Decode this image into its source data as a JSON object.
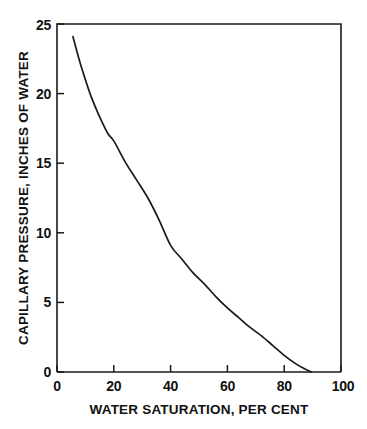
{
  "chart_data": {
    "type": "line",
    "title": "",
    "xlabel": "WATER SATURATION, PER CENT",
    "ylabel": "CAPILLARY PRESSURE, INCHES OF WATER",
    "xlim": [
      0,
      100
    ],
    "ylim": [
      0,
      25
    ],
    "xticks": [
      0,
      20,
      40,
      60,
      80,
      100
    ],
    "yticks": [
      0,
      5,
      10,
      15,
      20,
      25
    ],
    "xtick_labels": [
      "0",
      "20",
      "40",
      "60",
      "80",
      "100"
    ],
    "ytick_labels": [
      "0",
      "5",
      "10",
      "15",
      "20",
      "25"
    ],
    "grid": false,
    "legend": null,
    "series": [
      {
        "name": "capillary pressure curve",
        "color": "#1a1a1a",
        "x": [
          5.6,
          8,
          10,
          12,
          14,
          16,
          18,
          20,
          24,
          28,
          32,
          36,
          40,
          44,
          48,
          52,
          56,
          60,
          64,
          68,
          72,
          76,
          80,
          84,
          87,
          89.5
        ],
        "y": [
          24.1,
          22.3,
          21.0,
          19.8,
          18.8,
          17.9,
          17.1,
          16.6,
          15.1,
          13.8,
          12.5,
          10.9,
          9.1,
          8.1,
          7.1,
          6.3,
          5.4,
          4.6,
          3.9,
          3.2,
          2.6,
          1.9,
          1.2,
          0.6,
          0.25,
          0.0
        ]
      }
    ]
  },
  "figure": {
    "background_color": "#ffffff",
    "axis_color": "#1a1a1a",
    "plot_left_px": 57,
    "plot_right_px": 341,
    "plot_top_px": 24,
    "plot_bottom_px": 372
  }
}
